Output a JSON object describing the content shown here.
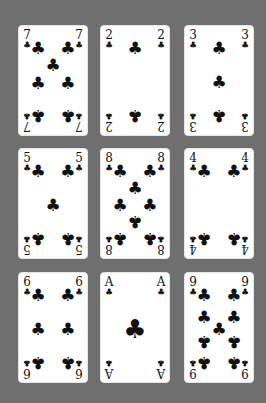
{
  "table": {
    "background": "#6f6f6f"
  },
  "suit_symbol": "♣",
  "cards": [
    {
      "rank": "7",
      "suit": "clubs",
      "x": 18,
      "y": 25,
      "pips": [
        [
          28,
          20,
          0
        ],
        [
          72,
          20,
          0
        ],
        [
          50,
          36,
          0
        ],
        [
          28,
          52,
          0
        ],
        [
          72,
          52,
          0
        ],
        [
          28,
          82,
          1
        ],
        [
          72,
          82,
          1
        ]
      ]
    },
    {
      "rank": "2",
      "suit": "clubs",
      "x": 100,
      "y": 25,
      "pips": [
        [
          50,
          20,
          0
        ],
        [
          50,
          82,
          1
        ]
      ]
    },
    {
      "rank": "3",
      "suit": "clubs",
      "x": 184,
      "y": 25,
      "pips": [
        [
          50,
          20,
          0
        ],
        [
          50,
          51,
          0
        ],
        [
          50,
          82,
          1
        ]
      ]
    },
    {
      "rank": "5",
      "suit": "clubs",
      "x": 18,
      "y": 148,
      "pips": [
        [
          28,
          20,
          0
        ],
        [
          72,
          20,
          0
        ],
        [
          50,
          51,
          0
        ],
        [
          28,
          82,
          1
        ],
        [
          72,
          82,
          1
        ]
      ]
    },
    {
      "rank": "8",
      "suit": "clubs",
      "x": 100,
      "y": 148,
      "pips": [
        [
          28,
          20,
          0
        ],
        [
          72,
          20,
          0
        ],
        [
          50,
          36,
          0
        ],
        [
          28,
          51,
          0
        ],
        [
          72,
          51,
          0
        ],
        [
          50,
          66,
          1
        ],
        [
          28,
          82,
          1
        ],
        [
          72,
          82,
          1
        ]
      ]
    },
    {
      "rank": "4",
      "suit": "clubs",
      "x": 184,
      "y": 148,
      "pips": [
        [
          28,
          20,
          0
        ],
        [
          72,
          20,
          0
        ],
        [
          28,
          82,
          1
        ],
        [
          72,
          82,
          1
        ]
      ]
    },
    {
      "rank": "6",
      "suit": "clubs",
      "x": 18,
      "y": 272,
      "pips": [
        [
          28,
          20,
          0
        ],
        [
          72,
          20,
          0
        ],
        [
          28,
          51,
          0
        ],
        [
          72,
          51,
          0
        ],
        [
          28,
          82,
          1
        ],
        [
          72,
          82,
          1
        ]
      ]
    },
    {
      "rank": "A",
      "suit": "clubs",
      "x": 100,
      "y": 272,
      "pips": [
        [
          50,
          51,
          0,
          1
        ]
      ]
    },
    {
      "rank": "9",
      "suit": "clubs",
      "x": 184,
      "y": 272,
      "pips": [
        [
          28,
          20,
          0
        ],
        [
          72,
          20,
          0
        ],
        [
          28,
          40,
          0
        ],
        [
          72,
          40,
          0
        ],
        [
          50,
          51,
          0
        ],
        [
          28,
          62,
          1
        ],
        [
          72,
          62,
          1
        ],
        [
          28,
          82,
          1
        ],
        [
          72,
          82,
          1
        ]
      ]
    }
  ]
}
